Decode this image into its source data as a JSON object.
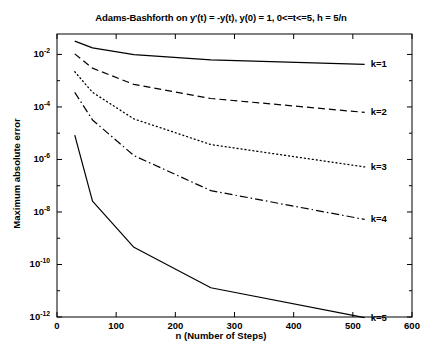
{
  "chart_data": {
    "type": "line",
    "title": "Adams-Bashforth on y'(t) = -y(t), y(0) = 1, 0<=t<=5, h = 5/n",
    "xlabel": "n (Number of Steps)",
    "ylabel": "Maximum absolute error",
    "yscale": "log",
    "xlim": [
      0,
      600
    ],
    "ylim": [
      1e-12,
      0.06
    ],
    "grid": false,
    "legend_position": "right-outside",
    "xticks": [
      0,
      100,
      200,
      300,
      400,
      500,
      600
    ],
    "xtick_labels": [
      "0",
      "100",
      "200",
      "300",
      "400",
      "500",
      "600"
    ],
    "yticks": [
      0.01,
      0.0001,
      1e-06,
      1e-08,
      1e-10,
      1e-12
    ],
    "ytick_labels": [
      "10-2",
      "10-4",
      "10-6",
      "10-8",
      "10-10",
      "10-12"
    ],
    "ytick_mantissa": [
      "10",
      "10",
      "10",
      "10",
      "10",
      "10"
    ],
    "ytick_exponent": [
      "-2",
      "-4",
      "-6",
      "-8",
      "-10",
      "-12"
    ],
    "series": [
      {
        "name": "k=1",
        "label": "k=1",
        "linestyle": "solid",
        "color": "#000000",
        "x": [
          30,
          60,
          130,
          260,
          520
        ],
        "y": [
          0.032,
          0.0178,
          0.0098,
          0.0062,
          0.0042
        ]
      },
      {
        "name": "k=2",
        "label": "k=2",
        "linestyle": "dashed",
        "color": "#000000",
        "x": [
          30,
          60,
          130,
          260,
          520
        ],
        "y": [
          0.0105,
          0.003,
          0.00072,
          0.00021,
          6.2e-05
        ]
      },
      {
        "name": "k=3",
        "label": "k=3",
        "linestyle": "dotted",
        "color": "#000000",
        "x": [
          30,
          60,
          130,
          260,
          520
        ],
        "y": [
          0.0022,
          0.00036,
          3.5e-05,
          3.7e-06,
          5.2e-07
        ]
      },
      {
        "name": "k=4",
        "label": "k=4",
        "linestyle": "dashdot",
        "color": "#000000",
        "x": [
          30,
          60,
          130,
          260,
          520
        ],
        "y": [
          0.00036,
          3.2e-05,
          1.4e-06,
          6.5e-08,
          5.2e-09
        ]
      },
      {
        "name": "k=5",
        "label": "k=5",
        "linestyle": "solid",
        "color": "#000000",
        "x": [
          30,
          60,
          130,
          260,
          520
        ],
        "y": [
          8.5e-06,
          2.6e-08,
          4.5e-10,
          1.3e-11,
          9.5e-13
        ]
      }
    ]
  },
  "axes": {
    "title": "Adams-Bashforth on y'(t) = -y(t), y(0) = 1, 0<=t<=5, h = 5/n",
    "xlabel": "n (Number of Steps)",
    "ylabel": "Maximum absolute error"
  }
}
